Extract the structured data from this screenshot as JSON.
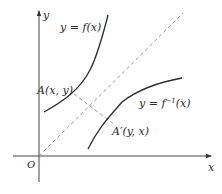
{
  "figure": {
    "axes": {
      "x_label": "x",
      "y_label": "y",
      "origin_label": "O"
    },
    "curves": [
      {
        "name": "f",
        "label": "y = f(x)",
        "color": "#2a2a2a"
      },
      {
        "name": "f_inverse",
        "label_prefix": "y = f",
        "label_sup": "−1",
        "label_suffix": "(x)",
        "color": "#2a2a2a"
      }
    ],
    "mirror_line": {
      "equation": "y = x",
      "style": "dashed",
      "color": "#888888"
    },
    "points": {
      "A": {
        "label": "A(x, y)"
      },
      "A_prime": {
        "label": "A′(y, x)"
      }
    },
    "colors": {
      "axis": "#444444",
      "curve": "#2a2a2a",
      "dashed": "#8a8a8a",
      "background": "#ffffff"
    }
  }
}
